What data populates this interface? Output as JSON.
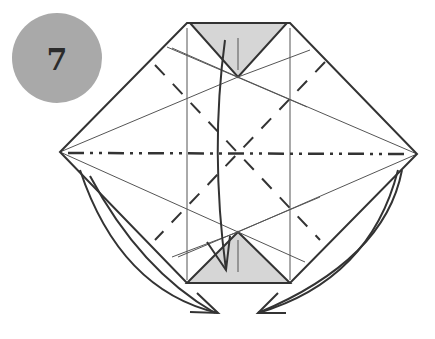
{
  "step": {
    "number": "7",
    "badge_color": "#a9a9a9"
  },
  "colors": {
    "line": "#333333",
    "fill": "#d6d6d6",
    "thin": "#555555"
  },
  "diagram": {
    "outline": [
      [
        60,
        152
      ],
      [
        187,
        23
      ],
      [
        290,
        23
      ],
      [
        417,
        154
      ],
      [
        290,
        283
      ],
      [
        187,
        283
      ]
    ],
    "top_flap": [
      [
        193,
        23
      ],
      [
        285,
        23
      ],
      [
        238,
        77
      ]
    ],
    "bottom_flap": [
      [
        187,
        283
      ],
      [
        290,
        283
      ],
      [
        238,
        232
      ]
    ],
    "mountain_fold_y": 153,
    "arrows": [
      "fold top flap down",
      "fold left and right sides behind"
    ]
  }
}
